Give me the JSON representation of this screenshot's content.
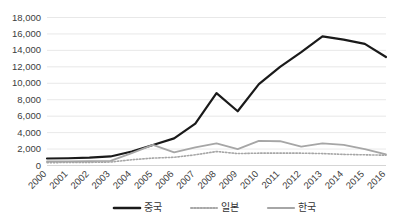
{
  "chart_data": {
    "type": "line",
    "title": "",
    "xlabel": "",
    "ylabel": "",
    "grid": true,
    "legend_position": "bottom",
    "ylim": [
      0,
      18000
    ],
    "ytick_labels": [
      "18,000",
      "16,000",
      "14,000",
      "12,000",
      "10,000",
      "8,000",
      "6,000",
      "4,000",
      "2,000",
      "0"
    ],
    "ytick_values": [
      18000,
      16000,
      14000,
      12000,
      10000,
      8000,
      6000,
      4000,
      2000,
      0
    ],
    "categories": [
      "2000",
      "2001",
      "2002",
      "2003",
      "2004",
      "2005",
      "2006",
      "2007",
      "2008",
      "2009",
      "2010",
      "2011",
      "2012",
      "2013",
      "2014",
      "2015",
      "2016"
    ],
    "x": [
      2000,
      2001,
      2002,
      2003,
      2004,
      2005,
      2006,
      2007,
      2008,
      2009,
      2010,
      2011,
      2012,
      2013,
      2014,
      2015,
      2016
    ],
    "series": [
      {
        "name": "중국",
        "color": "#1a1a1a",
        "style": "solid",
        "width": 2.2,
        "values": [
          850,
          880,
          950,
          1100,
          1700,
          2500,
          3300,
          5100,
          8800,
          6600,
          9900,
          12000,
          13800,
          15700,
          15300,
          14800,
          13200
        ]
      },
      {
        "name": "일본",
        "color": "#a6a6a6",
        "style": "dotted",
        "width": 1.6,
        "values": [
          350,
          360,
          380,
          420,
          700,
          900,
          1000,
          1300,
          1700,
          1450,
          1500,
          1500,
          1500,
          1450,
          1350,
          1300,
          1250
        ]
      },
      {
        "name": "한국",
        "color": "#a6a6a6",
        "style": "solid",
        "width": 1.8,
        "values": [
          500,
          500,
          520,
          560,
          1500,
          2500,
          1600,
          2200,
          2700,
          2000,
          3000,
          2950,
          2300,
          2700,
          2500,
          2000,
          1350
        ]
      }
    ]
  },
  "legend": {
    "items": [
      {
        "label": "중국",
        "swatch": "solid-black-line"
      },
      {
        "label": "일본",
        "swatch": "dotted-gray-line"
      },
      {
        "label": "한국",
        "swatch": "solid-gray-line"
      }
    ]
  },
  "colors": {
    "china": "#1a1a1a",
    "japan": "#a6a6a6",
    "korea": "#a6a6a6",
    "grid": "#e2e2e2",
    "text": "#404040",
    "background": "#ffffff"
  }
}
